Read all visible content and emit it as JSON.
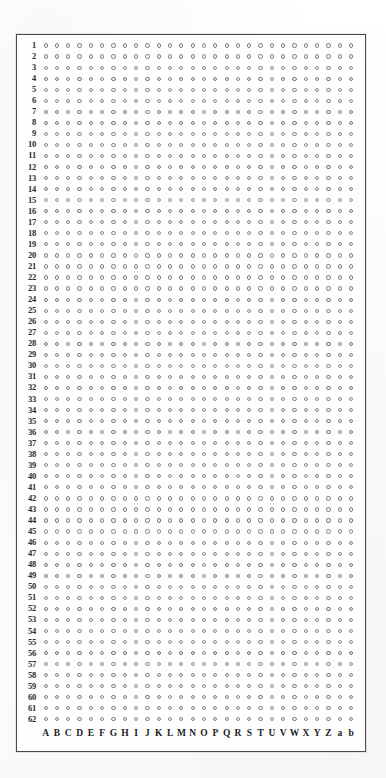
{
  "figure": {
    "kind": "microtiter-grid",
    "marker_glyph": "open-circle",
    "frame_color": "#4a4a4a",
    "marker_color": "#7b7b7b",
    "paper_color": "#fdfdfd",
    "row_count": 62,
    "column_count": 28,
    "row_labels": [
      "1",
      "2",
      "3",
      "4",
      "5",
      "6",
      "7",
      "8",
      "9",
      "10",
      "11",
      "12",
      "13",
      "14",
      "15",
      "16",
      "17",
      "18",
      "19",
      "20",
      "21",
      "22",
      "23",
      "24",
      "25",
      "26",
      "27",
      "28",
      "29",
      "30",
      "31",
      "32",
      "33",
      "34",
      "35",
      "36",
      "37",
      "38",
      "39",
      "40",
      "41",
      "42",
      "43",
      "44",
      "45",
      "46",
      "47",
      "48",
      "49",
      "50",
      "51",
      "52",
      "53",
      "54",
      "55",
      "56",
      "57",
      "58",
      "59",
      "60",
      "61",
      "62"
    ],
    "column_labels": [
      "A",
      "B",
      "C",
      "D",
      "E",
      "F",
      "G",
      "H",
      "I",
      "J",
      "K",
      "L",
      "M",
      "N",
      "O",
      "P",
      "Q",
      "R",
      "S",
      "T",
      "U",
      "V",
      "W",
      "X",
      "Y",
      "Z",
      "a",
      "b"
    ]
  }
}
